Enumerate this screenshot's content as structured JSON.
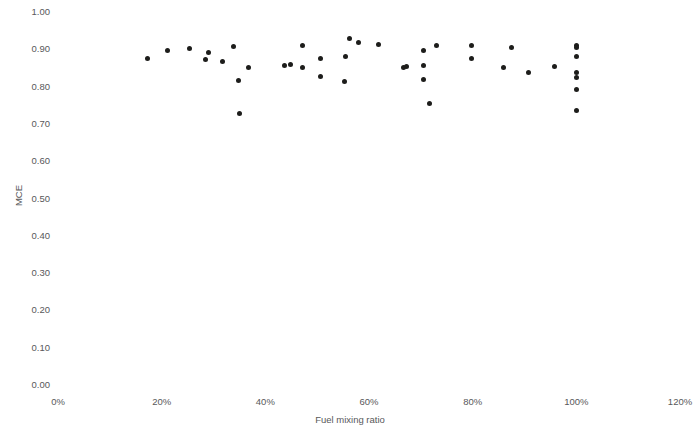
{
  "chart_data": {
    "type": "scatter",
    "title": "",
    "xlabel": "Fuel mixing ratio",
    "ylabel": "MCE",
    "xlim": [
      0,
      120
    ],
    "ylim": [
      0.0,
      1.0
    ],
    "x_tick_labels": [
      "0%",
      "20%",
      "40%",
      "60%",
      "80%",
      "100%",
      "120%"
    ],
    "x_ticks": [
      0,
      20,
      40,
      60,
      80,
      100,
      120
    ],
    "y_tick_labels": [
      "0.00",
      "0.10",
      "0.20",
      "0.30",
      "0.40",
      "0.50",
      "0.60",
      "0.70",
      "0.80",
      "0.90",
      "1.00"
    ],
    "y_ticks": [
      0.0,
      0.1,
      0.2,
      0.3,
      0.4,
      0.5,
      0.6,
      0.7,
      0.8,
      0.9,
      1.0
    ],
    "grid": false,
    "legend": false,
    "marker_color": "#1d1d1b",
    "marker_size": 5,
    "points": [
      {
        "x": 17.3,
        "y": 0.876
      },
      {
        "x": 21.2,
        "y": 0.897
      },
      {
        "x": 25.3,
        "y": 0.903
      },
      {
        "x": 29.0,
        "y": 0.892
      },
      {
        "x": 28.4,
        "y": 0.873
      },
      {
        "x": 31.8,
        "y": 0.868
      },
      {
        "x": 33.9,
        "y": 0.908
      },
      {
        "x": 34.9,
        "y": 0.816
      },
      {
        "x": 35.1,
        "y": 0.727
      },
      {
        "x": 36.7,
        "y": 0.851
      },
      {
        "x": 43.7,
        "y": 0.857
      },
      {
        "x": 44.9,
        "y": 0.86
      },
      {
        "x": 47.1,
        "y": 0.851
      },
      {
        "x": 47.1,
        "y": 0.911
      },
      {
        "x": 50.6,
        "y": 0.827
      },
      {
        "x": 50.6,
        "y": 0.876
      },
      {
        "x": 56.3,
        "y": 0.93
      },
      {
        "x": 58.0,
        "y": 0.919
      },
      {
        "x": 55.5,
        "y": 0.881
      },
      {
        "x": 61.8,
        "y": 0.913
      },
      {
        "x": 66.7,
        "y": 0.851
      },
      {
        "x": 55.3,
        "y": 0.814
      },
      {
        "x": 70.6,
        "y": 0.897
      },
      {
        "x": 73.1,
        "y": 0.911
      },
      {
        "x": 79.8,
        "y": 0.911
      },
      {
        "x": 79.8,
        "y": 0.876
      },
      {
        "x": 70.6,
        "y": 0.857
      },
      {
        "x": 70.6,
        "y": 0.819
      },
      {
        "x": 71.6,
        "y": 0.754
      },
      {
        "x": 67.3,
        "y": 0.854
      },
      {
        "x": 87.5,
        "y": 0.905
      },
      {
        "x": 85.9,
        "y": 0.851
      },
      {
        "x": 90.8,
        "y": 0.838
      },
      {
        "x": 95.7,
        "y": 0.854
      },
      {
        "x": 100.0,
        "y": 0.911
      },
      {
        "x": 100.0,
        "y": 0.905
      },
      {
        "x": 100.0,
        "y": 0.881
      },
      {
        "x": 100.0,
        "y": 0.838
      },
      {
        "x": 100.0,
        "y": 0.824
      },
      {
        "x": 100.0,
        "y": 0.792
      },
      {
        "x": 100.0,
        "y": 0.735
      }
    ]
  }
}
